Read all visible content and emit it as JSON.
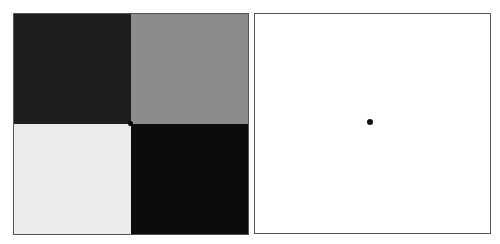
{
  "left_panel": {
    "quadrants": [
      {
        "position": "top-left",
        "color": "#1e1e1e"
      },
      {
        "position": "top-right",
        "color": "#8c8c8c"
      },
      {
        "position": "bottom-left",
        "color": "#ececec"
      },
      {
        "position": "bottom-right",
        "color": "#0c0c0c"
      }
    ],
    "center_mark_color": "#000000"
  },
  "right_panel": {
    "background": "#ffffff",
    "dot": {
      "x": 114,
      "y": 107,
      "color": "#111111"
    }
  }
}
